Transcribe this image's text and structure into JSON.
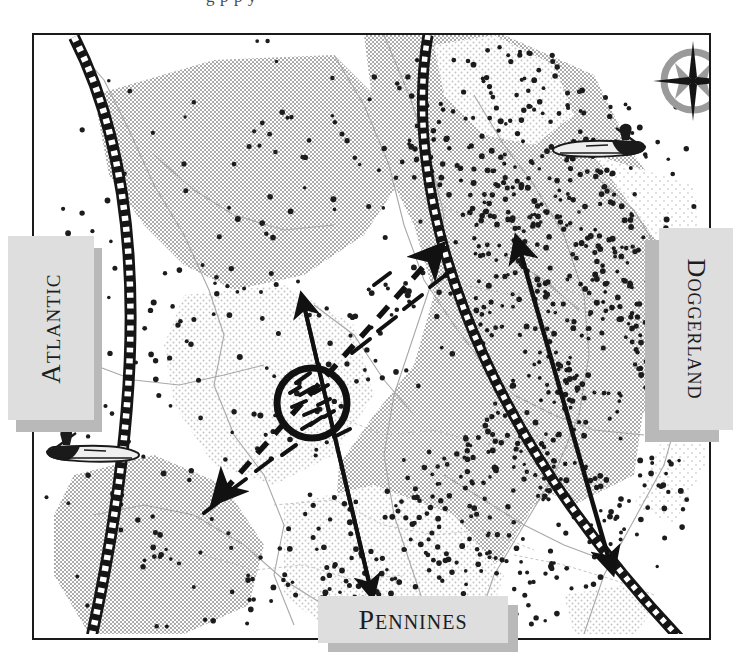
{
  "page": {
    "caption_fragment": "g   p           p y",
    "width": 739,
    "height": 660
  },
  "map": {
    "title": "Doggerland Mesolithic map",
    "labels": {
      "atlantic": "Atlantic",
      "doggerland": "Doggerland",
      "pennines": "Pennines"
    },
    "icons": {
      "compass": "compass-rose-icon",
      "boat_right": "canoe-paddler-icon",
      "boat_left": "canoe-paddler-icon-mirrored"
    },
    "colors": {
      "frame": "#1a1a1a",
      "label_box": "#dedede",
      "label_shadow": "#b9b9b9",
      "land_shade": "#d2d2d2",
      "land_shade_light": "#e6e6e6",
      "coastline": "#b5b5b5",
      "site_dot": "#1c1c1c",
      "arrow": "#111111",
      "band": "#151515"
    },
    "features": {
      "hatched_band_left": "ice-margin-band-left",
      "hatched_band_right": "ice-margin-band-right",
      "circle_marker": "site-cluster-circle",
      "arrow_solid_vertical": "migration-arrow-north-south",
      "arrow_dashed_diagonal": "migration-arrow-dashed-ne-sw",
      "arrow_solid_right": "migration-arrow-ne-se"
    }
  },
  "chart_data": {
    "type": "map",
    "title": "Doggerland",
    "annotations": [
      "Atlantic",
      "Doggerland",
      "Pennines"
    ],
    "legend_position": "none",
    "grid": false
  }
}
